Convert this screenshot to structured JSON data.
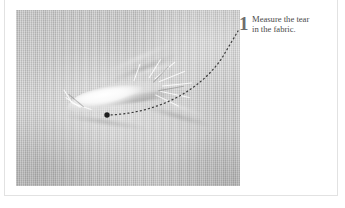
{
  "figure": {
    "photo_alt": "grayscale close-up photograph of torn gray woven fabric",
    "background_color": "#c9c9c9",
    "tear_highlight_color": "#ffffff"
  },
  "callout": {
    "number": "1",
    "number_color": "#6d6d6d",
    "text_color": "#4a4a4a",
    "lines": [
      "Measure the tear",
      "in the fabric."
    ],
    "full_text": "Measure the tear in the fabric."
  },
  "leader": {
    "style": "dotted",
    "color": "#3c3c3c",
    "marker": "endpoint-dot",
    "marker_x": 107,
    "marker_y": 115,
    "target_x": 238,
    "target_y": 31
  },
  "page": {
    "background_color": "#ffffff",
    "border_color": "#e2e2e2"
  }
}
